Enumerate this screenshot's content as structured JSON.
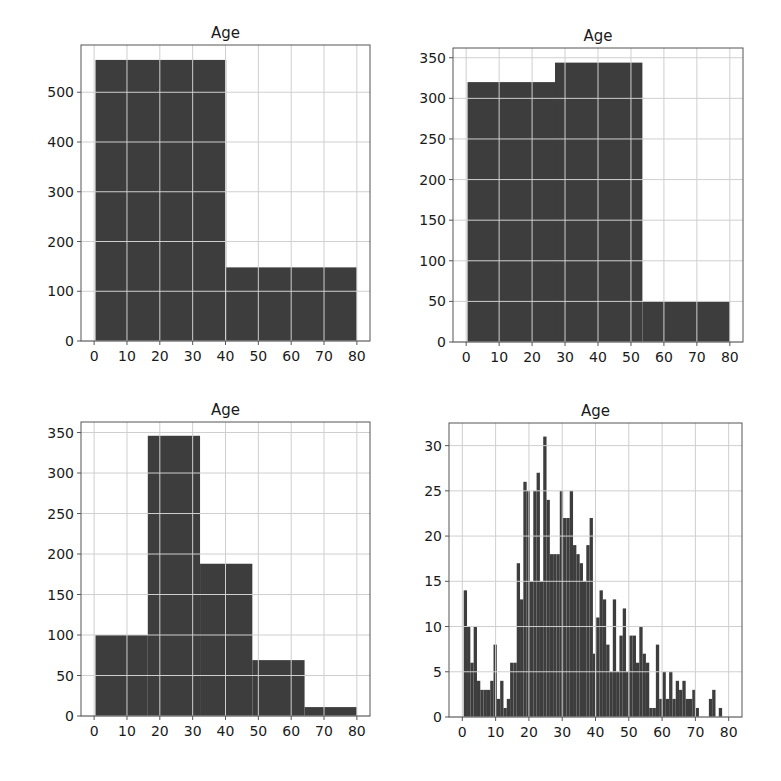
{
  "colors": {
    "bar": "#3d3d3d",
    "grid": "#cfcfcf",
    "axis": "#555555",
    "background": "#ffffff"
  },
  "chart_data": [
    {
      "type": "bar",
      "title": "Age",
      "xlabel": "",
      "ylabel": "",
      "bins": 2,
      "bin_edges": [
        0.42,
        40.21,
        80.0
      ],
      "values": [
        565,
        148
      ],
      "xlim": [
        -4,
        84
      ],
      "ylim": [
        0,
        595
      ],
      "xticks": [
        0,
        10,
        20,
        30,
        40,
        50,
        60,
        70,
        80
      ],
      "yticks": [
        0,
        100,
        200,
        300,
        400,
        500
      ],
      "grid": true
    },
    {
      "type": "bar",
      "title": "Age",
      "xlabel": "",
      "ylabel": "",
      "bins": 3,
      "bin_edges": [
        0.42,
        26.95,
        53.47,
        80.0
      ],
      "values": [
        320,
        344,
        50
      ],
      "xlim": [
        -4,
        84
      ],
      "ylim": [
        0,
        362
      ],
      "xticks": [
        0,
        10,
        20,
        30,
        40,
        50,
        60,
        70,
        80
      ],
      "yticks": [
        0,
        50,
        100,
        150,
        200,
        250,
        300,
        350
      ],
      "grid": true
    },
    {
      "type": "bar",
      "title": "Age",
      "xlabel": "",
      "ylabel": "",
      "bins": 5,
      "bin_edges": [
        0.42,
        16.34,
        32.25,
        48.17,
        64.08,
        80.0
      ],
      "values": [
        100,
        346,
        188,
        69,
        11
      ],
      "xlim": [
        -4,
        84
      ],
      "ylim": [
        0,
        363
      ],
      "xticks": [
        0,
        10,
        20,
        30,
        40,
        50,
        60,
        70,
        80
      ],
      "yticks": [
        0,
        50,
        100,
        150,
        200,
        250,
        300,
        350
      ],
      "grid": true
    },
    {
      "type": "bar",
      "title": "Age",
      "xlabel": "",
      "ylabel": "",
      "bins": 80,
      "bin_edges_start": 0.42,
      "bin_width": 0.995,
      "values": [
        14,
        10,
        6,
        10,
        4,
        3,
        3,
        3,
        4,
        8,
        2,
        4,
        1,
        2,
        6,
        6,
        17,
        13,
        26,
        25,
        15,
        25,
        27,
        15,
        31,
        24,
        18,
        18,
        18,
        25,
        22,
        22,
        25,
        19,
        18,
        17,
        15,
        19,
        22,
        7,
        11,
        14,
        13,
        8,
        5,
        13,
        5,
        9,
        12,
        5,
        9,
        9,
        6,
        10,
        7,
        6,
        1,
        1,
        8,
        2,
        5,
        2,
        5,
        2,
        4,
        3,
        4,
        2,
        2,
        3,
        1,
        0,
        0,
        0,
        2,
        3,
        0,
        1,
        0,
        0
      ],
      "tail_values_note_omitted": false,
      "xlim": [
        -4,
        84
      ],
      "ylim": [
        0,
        32.5
      ],
      "xticks": [
        0,
        10,
        20,
        30,
        40,
        50,
        60,
        70,
        80
      ],
      "yticks": [
        0,
        5,
        10,
        15,
        20,
        25,
        30
      ],
      "grid": true
    }
  ],
  "panels": [
    {
      "title": "Age",
      "box": {
        "left": 81,
        "top": 45,
        "width": 289,
        "height": 296
      }
    },
    {
      "title": "Age",
      "box": {
        "left": 453,
        "top": 48,
        "width": 290,
        "height": 294
      }
    },
    {
      "title": "Age",
      "box": {
        "left": 81,
        "top": 422,
        "width": 289,
        "height": 294
      }
    },
    {
      "title": "Age",
      "box": {
        "left": 449,
        "top": 423,
        "width": 293,
        "height": 294
      }
    }
  ]
}
